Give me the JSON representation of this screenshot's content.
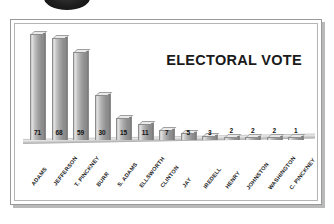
{
  "ornament": {
    "name": "dark-oval-graphic"
  },
  "chart_data": {
    "type": "bar",
    "title": "ELECTORAL VOTE",
    "xlabel": "",
    "ylabel": "",
    "ylim": [
      0,
      75
    ],
    "grid": false,
    "legend": "none",
    "orientation": "vertical",
    "style": "3d-grayscale",
    "categories": [
      "ADAMS",
      "JEFFERSON",
      "T. PINCKNEY",
      "BURR",
      "S. ADAMS",
      "ELLSWORTH",
      "CLINTON",
      "JAY",
      "IREDELL",
      "HENRY",
      "JOHNSTON",
      "WASHINGTON",
      "C. PINCKNEY"
    ],
    "values": [
      71,
      68,
      59,
      30,
      15,
      11,
      7,
      5,
      3,
      2,
      2,
      2,
      1
    ],
    "value_labels": [
      "71",
      "68",
      "59",
      "30",
      "15",
      "11",
      "7",
      "5",
      "3",
      "2",
      "2",
      "2",
      "1"
    ],
    "label_positions": [
      "inside",
      "inside",
      "inside",
      "inside",
      "inside",
      "inside",
      "inside",
      "inside",
      "inside",
      "above",
      "above",
      "above",
      "above"
    ],
    "colors": {
      "bar_face_light": "#dedede",
      "bar_face_dark": "#8b8b8b",
      "bar_side": "#787878",
      "bar_outline": "#8d8d8d",
      "title_text": "#1a1a1a",
      "label_text": "#1c1c1c",
      "background": "#ffffff",
      "frame": "#9a9a9a",
      "baseline": "#d2d2d2"
    }
  }
}
